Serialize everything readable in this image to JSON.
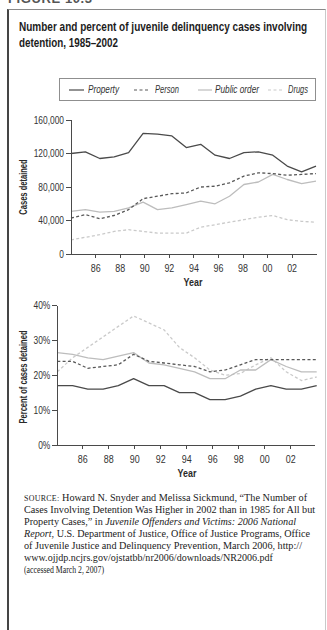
{
  "figure_label": "FIGURE 10.3",
  "title": {
    "line1": "Number and percent of juvenile delinquency cases involving",
    "line2": "detention, 1985–2002"
  },
  "legend": {
    "items": [
      {
        "label": "Property",
        "color": "#4a4a4a",
        "dash": "solid"
      },
      {
        "label": "Person",
        "color": "#585858",
        "dash": "dashed"
      },
      {
        "label": "Public order",
        "color": "#bdbdbd",
        "dash": "solid"
      },
      {
        "label": "Drugs",
        "color": "#cacaca",
        "dash": "dashed"
      }
    ]
  },
  "chart_data": [
    {
      "type": "line",
      "title": "Number and percent of juvenile delinquency cases involving detention, 1985–2002",
      "xlabel": "Year",
      "ylabel": "Cases detained",
      "x": [
        1985,
        1986,
        1987,
        1988,
        1989,
        1990,
        1991,
        1992,
        1993,
        1994,
        1995,
        1996,
        1997,
        1998,
        1999,
        2000,
        2001,
        2002
      ],
      "xticks": [
        "86",
        "88",
        "90",
        "92",
        "94",
        "96",
        "98",
        "00",
        "02"
      ],
      "yticks": [
        "0",
        "40,000",
        "80,000",
        "120,000",
        "160,000"
      ],
      "ytick_values": [
        0,
        40000,
        80000,
        120000,
        160000
      ],
      "ylim": [
        0,
        160000
      ],
      "grid": false,
      "legend_position": "top",
      "series": [
        {
          "name": "Property",
          "values": [
            120000,
            122000,
            114000,
            116000,
            121000,
            144000,
            143000,
            141000,
            127000,
            131000,
            118000,
            114000,
            121000,
            122000,
            118000,
            105000,
            98000,
            105000
          ]
        },
        {
          "name": "Person",
          "values": [
            43000,
            47000,
            42000,
            46000,
            53000,
            66000,
            69000,
            72000,
            73000,
            80000,
            81000,
            85000,
            93000,
            97000,
            96000,
            94000,
            95000,
            96000
          ]
        },
        {
          "name": "Public order",
          "values": [
            51000,
            53000,
            50000,
            51000,
            55000,
            62000,
            53000,
            55000,
            59000,
            63000,
            60000,
            69000,
            83000,
            86000,
            95000,
            89000,
            84000,
            87000
          ]
        },
        {
          "name": "Drugs",
          "values": [
            17000,
            20000,
            23000,
            27000,
            29000,
            27000,
            25000,
            25000,
            25000,
            32000,
            35000,
            38000,
            41000,
            44000,
            46000,
            41000,
            39000,
            38000
          ]
        }
      ]
    },
    {
      "type": "line",
      "title": "Number and percent of juvenile delinquency cases involving detention, 1985–2002",
      "xlabel": "Year",
      "ylabel": "Percent of cases detained",
      "x": [
        1985,
        1986,
        1987,
        1988,
        1989,
        1990,
        1991,
        1992,
        1993,
        1994,
        1995,
        1996,
        1997,
        1998,
        1999,
        2000,
        2001,
        2002
      ],
      "xticks": [
        "86",
        "88",
        "90",
        "92",
        "94",
        "96",
        "98",
        "00",
        "02"
      ],
      "yticks": [
        "0%",
        "10%",
        "20%",
        "30%",
        "40%"
      ],
      "ytick_values": [
        0,
        10,
        20,
        30,
        40
      ],
      "ylim": [
        0,
        40
      ],
      "grid": false,
      "series": [
        {
          "name": "Property",
          "values": [
            17,
            17,
            16,
            16,
            17,
            19,
            17,
            17,
            15,
            15,
            13,
            13,
            14,
            16,
            17,
            16,
            16,
            17
          ]
        },
        {
          "name": "Person",
          "values": [
            24,
            24,
            22,
            22.5,
            23,
            26,
            24,
            23.5,
            23,
            22.5,
            21,
            21.5,
            23,
            24.5,
            24.5,
            24.5,
            24.5,
            24.5
          ]
        },
        {
          "name": "Public order",
          "values": [
            26.5,
            26,
            25,
            24.5,
            25.5,
            26.5,
            23.5,
            23,
            22,
            21,
            19,
            19,
            21.5,
            21.5,
            24.5,
            22.5,
            21,
            21
          ]
        },
        {
          "name": "Drugs",
          "values": [
            21,
            25,
            28,
            31,
            34,
            37,
            35,
            33,
            28,
            25,
            21.5,
            20,
            20.5,
            23,
            25,
            21,
            18.5,
            19.5
          ]
        }
      ]
    }
  ],
  "source": {
    "label": "SOURCE:",
    "line1": " Howard N. Snyder and Melissa Sickmund, “The Number of",
    "line2": "Cases Involving Detention Was Higher in 2002 than in 1985 for All but",
    "line3_a": "Property Cases,” in ",
    "line3_b": "Juvenile Offenders and Victims: 2006 National",
    "line4_a": "Report",
    "line4_b": ", U.S. Department of Justice, Office of Justice Programs, Office",
    "line5": "of Juvenile Justice and Delinquency Prevention, March 2006, http://",
    "line6": "www.ojjdp.ncjrs.gov/ojstatbb/nr2006/downloads/NR2006.pdf",
    "line7": "(accessed March 2, 2007)"
  }
}
